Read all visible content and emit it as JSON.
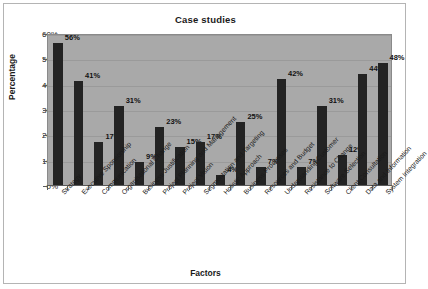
{
  "chart_data": {
    "type": "bar",
    "title": "Case studies",
    "xlabel": "Factors",
    "ylabel": "Percentage",
    "ylim": [
      0,
      60
    ],
    "ytick_labels": [
      "0%",
      "10%",
      "20%",
      "30%",
      "40%",
      "50%",
      "60%"
    ],
    "ytick_values": [
      0,
      10,
      20,
      30,
      40,
      50,
      60
    ],
    "grid": true,
    "legend": false,
    "bar_color": "#232323",
    "plot_background": "#a9a9a9",
    "categories": [
      "Strategy",
      "Executive Sponsorship",
      "Communication",
      "Organisational Change",
      "Business Justification",
      "Project Planning and Management",
      "Project Vision",
      "Segmentation and Targeting",
      "Holistic Approach",
      "Business Processes",
      "Resources and Budget",
      "Understanding Customer",
      "Resistance to Change",
      "Software Selection",
      "Client Consultation",
      "Data and Information",
      "System Integration"
    ],
    "values": [
      56,
      41,
      17,
      31,
      9,
      23,
      15,
      17,
      4,
      25,
      7,
      42,
      7,
      31,
      12,
      44,
      48
    ],
    "value_labels": [
      "56%",
      "41%",
      "17%",
      "31%",
      "9%",
      "23%",
      "15%",
      "17%",
      "4%",
      "25%",
      "7%",
      "42%",
      "7%",
      "31%",
      "12%",
      "44%",
      "48%"
    ]
  }
}
